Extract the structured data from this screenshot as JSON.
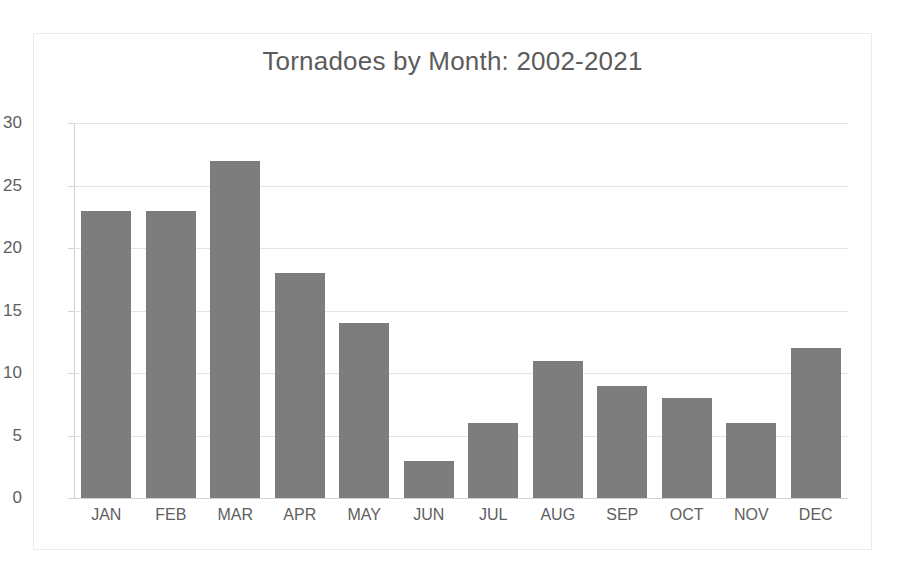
{
  "chart_data": {
    "type": "bar",
    "title": "Tornadoes by Month: 2002-2021",
    "xlabel": "",
    "ylabel": "",
    "categories": [
      "JAN",
      "FEB",
      "MAR",
      "APR",
      "MAY",
      "JUN",
      "JUL",
      "AUG",
      "SEP",
      "OCT",
      "NOV",
      "DEC"
    ],
    "values": [
      23,
      23,
      27,
      18,
      14,
      3,
      6,
      11,
      9,
      8,
      6,
      12
    ],
    "ylim": [
      0,
      30
    ],
    "y_ticks": [
      0,
      5,
      10,
      15,
      20,
      25,
      30
    ],
    "y_tick_labels": [
      "0",
      "5",
      "10",
      "15",
      "20",
      "25",
      "30"
    ],
    "grid": true,
    "legend": false,
    "legend_position": "none",
    "series": [
      {
        "name": "Tornadoes",
        "values": [
          23,
          23,
          27,
          18,
          14,
          3,
          6,
          11,
          9,
          8,
          6,
          12
        ]
      }
    ],
    "colors": {
      "bar": "#7d7d7d",
      "title_text": "#5c5c5c",
      "tick_text": "#5e5e5e",
      "gridline": "#e4e4e4",
      "axis_line": "#d2d2d2",
      "plot_background": "#ffffff",
      "figure_border": "#ececec"
    }
  }
}
